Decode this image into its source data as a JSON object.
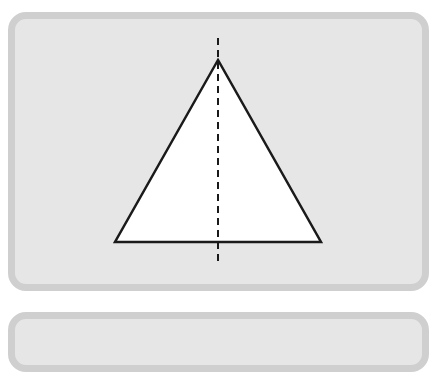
{
  "diagram": {
    "type": "geometry",
    "shape": "isosceles-triangle",
    "symmetry_axis": "vertical dashed line through apex",
    "triangle": {
      "apex": [
        218,
        60
      ],
      "base_left": [
        115,
        242
      ],
      "base_right": [
        321,
        242
      ],
      "fill": "#ffffff",
      "stroke": "#1a1a1a"
    },
    "axis_line": {
      "x": 218,
      "y_start": 38,
      "y_end": 265,
      "style": "dashed",
      "stroke": "#1a1a1a"
    },
    "colors": {
      "card_fill": "#e6e6e6",
      "card_border": "#cfcfcf",
      "background": "#ffffff"
    }
  }
}
